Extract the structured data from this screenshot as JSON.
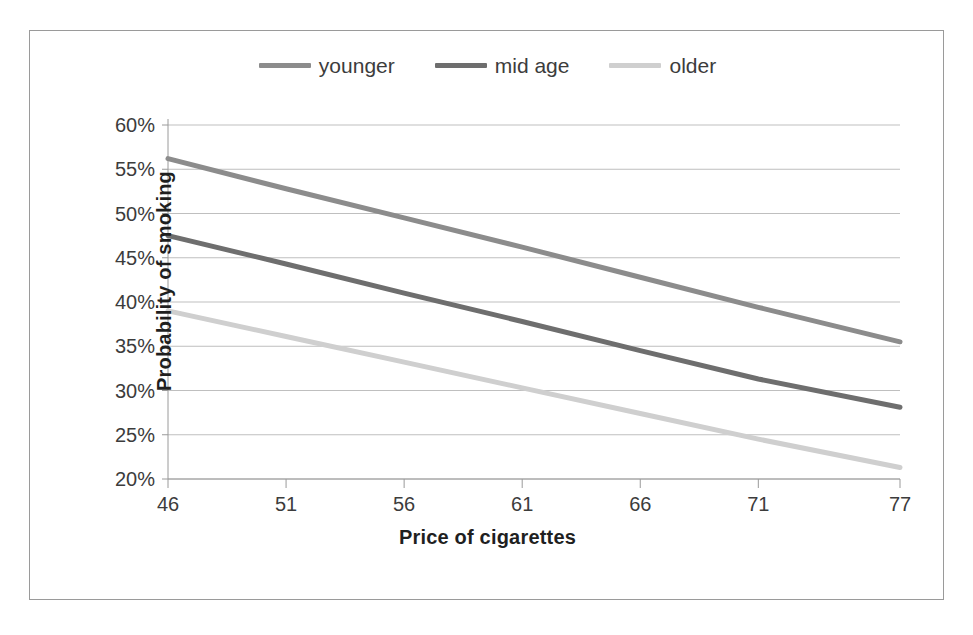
{
  "chart_data": {
    "type": "line",
    "title": "",
    "xlabel": "Price of cigarettes",
    "ylabel": "Probability of smoking",
    "x": [
      46,
      51,
      56,
      61,
      66,
      71,
      77
    ],
    "xtick_labels": [
      "46",
      "51",
      "56",
      "61",
      "66",
      "71",
      "77"
    ],
    "ytick_labels": [
      "20%",
      "25%",
      "30%",
      "35%",
      "40%",
      "45%",
      "50%",
      "55%",
      "60%"
    ],
    "ytick_values": [
      20,
      25,
      30,
      35,
      40,
      45,
      50,
      55,
      60
    ],
    "ylim": [
      20,
      60
    ],
    "xlim": [
      46,
      77
    ],
    "grid": "horizontal",
    "legend_position": "top-center",
    "series": [
      {
        "name": "younger",
        "color": "#8c8c8c",
        "values": [
          56.2,
          52.8,
          49.5,
          46.2,
          42.8,
          39.4,
          35.5
        ]
      },
      {
        "name": "mid age",
        "color": "#6e6e6e",
        "values": [
          47.5,
          44.3,
          41.0,
          37.8,
          34.5,
          31.3,
          28.1
        ]
      },
      {
        "name": "older",
        "color": "#cfcfcf",
        "values": [
          39.0,
          36.1,
          33.2,
          30.3,
          27.4,
          24.5,
          21.3
        ]
      }
    ]
  },
  "legend": {
    "items": [
      {
        "label": "younger",
        "color": "#8c8c8c"
      },
      {
        "label": "mid age",
        "color": "#6e6e6e"
      },
      {
        "label": "older",
        "color": "#cfcfcf"
      }
    ]
  },
  "axes": {
    "x_title": "Price of cigarettes",
    "y_title": "Probability of smoking"
  },
  "colors": {
    "frame": "#9a9a9a",
    "gridline": "#bfbfbf",
    "axis": "#9a9a9a",
    "text": "#3c3c3c",
    "title_text": "#1f1f1f"
  }
}
